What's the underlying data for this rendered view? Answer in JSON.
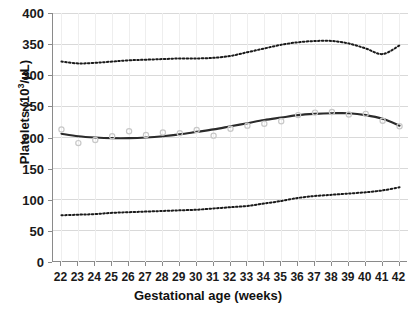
{
  "chart_data": {
    "type": "line",
    "title": "",
    "xlabel": "Gestational age (weeks)",
    "ylabel_text": "Platelets (10",
    "ylabel_sup": "3",
    "ylabel_tail": "/µL)",
    "ylabel_full": "Platelets (10³/µL)",
    "xlim": [
      21.5,
      42.5
    ],
    "ylim": [
      0,
      400
    ],
    "grid": true,
    "grid_color": "#d9d9d9",
    "legend": "none",
    "yticks": [
      0,
      50,
      100,
      150,
      200,
      250,
      300,
      350,
      400
    ],
    "ytick_labels": [
      "0",
      "50",
      "100",
      "150",
      "200",
      "250",
      "300",
      "350",
      "400"
    ],
    "xticks": [
      22,
      23,
      24,
      25,
      26,
      27,
      28,
      29,
      30,
      31,
      32,
      33,
      34,
      35,
      36,
      37,
      38,
      39,
      40,
      41,
      42
    ],
    "xtick_labels": [
      "22",
      "23",
      "24",
      "25",
      "26",
      "27",
      "28",
      "29",
      "30",
      "31",
      "32",
      "33",
      "34",
      "35",
      "36",
      "37",
      "38",
      "39",
      "40",
      "41",
      "42"
    ],
    "x": [
      22,
      23,
      24,
      25,
      26,
      27,
      28,
      29,
      30,
      31,
      32,
      33,
      34,
      35,
      36,
      37,
      38,
      39,
      40,
      41,
      42
    ],
    "series": [
      {
        "name": "upper-percentile",
        "style": "dotted",
        "color": "#1a1a1a",
        "values": [
          322,
          319,
          320,
          322,
          324,
          325,
          326,
          327,
          327,
          328,
          331,
          337,
          343,
          349,
          353,
          355,
          355,
          351,
          343,
          334,
          348
        ]
      },
      {
        "name": "mean-curve",
        "style": "solid",
        "color": "#2b2b2b",
        "values": [
          206,
          202,
          200,
          199,
          199,
          200,
          202,
          205,
          209,
          213,
          218,
          223,
          228,
          232,
          236,
          238,
          239,
          239,
          236,
          230,
          219
        ]
      },
      {
        "name": "lower-percentile",
        "style": "dotted",
        "color": "#1a1a1a",
        "values": [
          75,
          76,
          77,
          79,
          80,
          81,
          82,
          83,
          84,
          86,
          88,
          90,
          94,
          98,
          103,
          106,
          108,
          110,
          112,
          115,
          120
        ]
      },
      {
        "name": "observed-points",
        "style": "scatter",
        "color": "#c8c8c8",
        "values": [
          213,
          191,
          196,
          202,
          210,
          204,
          208,
          207,
          212,
          203,
          214,
          219,
          222,
          226,
          236,
          240,
          241,
          237,
          238,
          227,
          218
        ]
      }
    ]
  }
}
